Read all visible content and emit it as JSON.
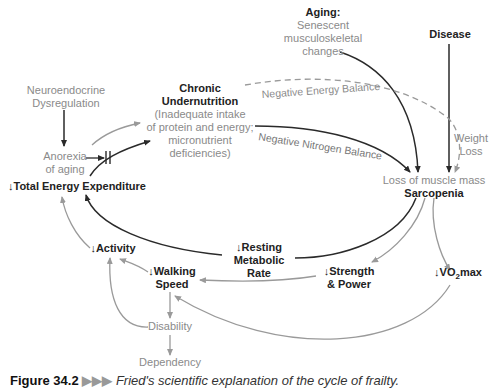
{
  "figure": {
    "nodes": {
      "aging_title": "Aging:",
      "aging_desc_1": "Senescent",
      "aging_desc_2": "musculoskeletal",
      "aging_desc_3": "changes",
      "disease": "Disease",
      "neuro_1": "Neuroendocrine",
      "neuro_2": "Dysregulation",
      "chronic_1": "Chronic",
      "chronic_2": "Undernutrition",
      "chronic_3": "(Inadequate intake",
      "chronic_4": "of protein and energy;",
      "chronic_5": "micronutrient",
      "chronic_6": "deficiencies)",
      "anorexia_1": "Anorexia",
      "anorexia_2": "of aging",
      "tee": "↓Total Energy Expenditure",
      "weight_loss_1": "Weight",
      "weight_loss_2": "Loss",
      "muscle_loss": "Loss of muscle mass",
      "sarcopenia": "Sarcopenia",
      "activity": "↓Activity",
      "resting_1": "↓Resting",
      "resting_2": "Metabolic",
      "resting_3": "Rate",
      "walking_1": "↓Walking",
      "walking_2": "Speed",
      "strength_1": "↓Strength",
      "strength_2": "& Power",
      "vo2_prefix": "↓VO",
      "vo2_sub": "2",
      "vo2_suffix": "max",
      "disability": "Disability",
      "dependency": "Dependency"
    },
    "edge_labels": {
      "neg_energy": "Negative Energy Balance",
      "neg_nitrogen": "Negative Nitrogen Balance"
    },
    "caption": {
      "label": "Figure 34.2",
      "arrows": "▶▶▶",
      "text": "Fried's scientific explanation of the cycle of frailty."
    },
    "colors": {
      "dark_line": "#2a2a2a",
      "grey_line": "#9a9a9a",
      "text_dark": "#222222",
      "text_grey": "#8a8a8a"
    }
  }
}
